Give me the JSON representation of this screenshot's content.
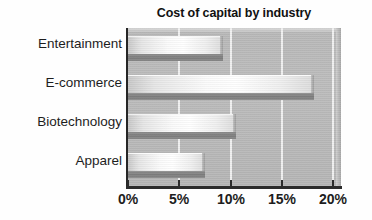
{
  "chart_data": {
    "type": "bar",
    "orientation": "horizontal",
    "title": "Cost of capital by industry",
    "xlabel": "",
    "ylabel": "",
    "categories": [
      "Entertainment",
      "E-commerce",
      "Biotechnology",
      "Apparel"
    ],
    "values": [
      9.3,
      18.1,
      10.5,
      7.5
    ],
    "value_unit": "%",
    "xlim": [
      0,
      20
    ],
    "xticks": [
      0,
      5,
      10,
      15,
      20
    ],
    "xtick_labels": [
      "0%",
      "5%",
      "10%",
      "15%",
      "20%"
    ],
    "grid": true,
    "grid_axis": "x",
    "grid_color": "#f4f4f4",
    "legend": false,
    "plot_background": "#bbbbbb",
    "bar_fill": "#ffffff",
    "bar_base_color": "#828282",
    "axis_color": "#2b2b2b",
    "text_color": "#1d1d1d"
  },
  "axis": {
    "tick_labels": [
      "0%",
      "5%",
      "10%",
      "15%",
      "20%"
    ]
  },
  "categories": {
    "labels": [
      "Entertainment",
      "E-commerce",
      "Biotechnology",
      "Apparel"
    ]
  }
}
